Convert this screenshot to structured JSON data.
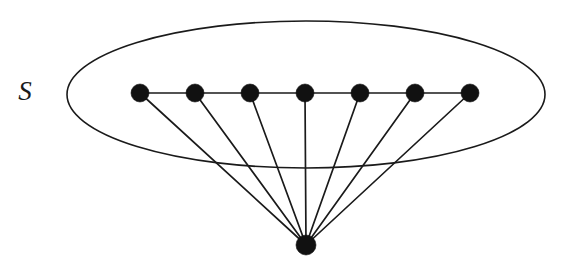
{
  "figure": {
    "background_color": "#ffffff",
    "stroke_color": "#1a1a1a",
    "node_color": "#111111",
    "width": 561,
    "height": 272
  },
  "labels": {
    "set_label": "S",
    "set_label_x": 25,
    "set_label_y": 100,
    "set_label_font_size": 27
  },
  "set_region": {
    "name": "ellipse-S",
    "cx": 306,
    "cy": 94.5,
    "rx": 239,
    "ry": 73.5,
    "stroke_width": 1.6
  },
  "graph_data": {
    "type": "graph",
    "description": "Seven independent-set vertices in a row inside ellipse S, each joined to a single apex vertex below; consecutive row vertices also joined by a path.",
    "node_radius_top": 9,
    "node_radius_apex": 10,
    "top_row_y": 93,
    "nodes": [
      {
        "id": "s1",
        "label": "",
        "x": 140,
        "y": 93,
        "r": 9,
        "group": "S"
      },
      {
        "id": "s2",
        "label": "",
        "x": 195,
        "y": 93,
        "r": 9,
        "group": "S"
      },
      {
        "id": "s3",
        "label": "",
        "x": 250,
        "y": 93,
        "r": 9,
        "group": "S"
      },
      {
        "id": "s4",
        "label": "",
        "x": 305,
        "y": 93,
        "r": 9,
        "group": "S"
      },
      {
        "id": "s5",
        "label": "",
        "x": 360,
        "y": 93,
        "r": 9,
        "group": "S"
      },
      {
        "id": "s6",
        "label": "",
        "x": 415,
        "y": 93,
        "r": 9,
        "group": "S"
      },
      {
        "id": "s7",
        "label": "",
        "x": 470,
        "y": 93,
        "r": 9,
        "group": "S"
      },
      {
        "id": "apex",
        "label": "",
        "x": 306,
        "y": 245,
        "r": 10,
        "group": "apex"
      }
    ],
    "edges": [
      {
        "from": "s1",
        "to": "s2",
        "kind": "path"
      },
      {
        "from": "s2",
        "to": "s3",
        "kind": "path"
      },
      {
        "from": "s3",
        "to": "s4",
        "kind": "path"
      },
      {
        "from": "s4",
        "to": "s5",
        "kind": "path"
      },
      {
        "from": "s5",
        "to": "s6",
        "kind": "path"
      },
      {
        "from": "s6",
        "to": "s7",
        "kind": "path"
      },
      {
        "from": "s1",
        "to": "apex",
        "kind": "spoke"
      },
      {
        "from": "s2",
        "to": "apex",
        "kind": "spoke"
      },
      {
        "from": "s3",
        "to": "apex",
        "kind": "spoke"
      },
      {
        "from": "s4",
        "to": "apex",
        "kind": "spoke"
      },
      {
        "from": "s5",
        "to": "apex",
        "kind": "spoke"
      },
      {
        "from": "s6",
        "to": "apex",
        "kind": "spoke"
      },
      {
        "from": "s7",
        "to": "apex",
        "kind": "spoke"
      }
    ],
    "node_count": 8,
    "edge_count": 13
  }
}
